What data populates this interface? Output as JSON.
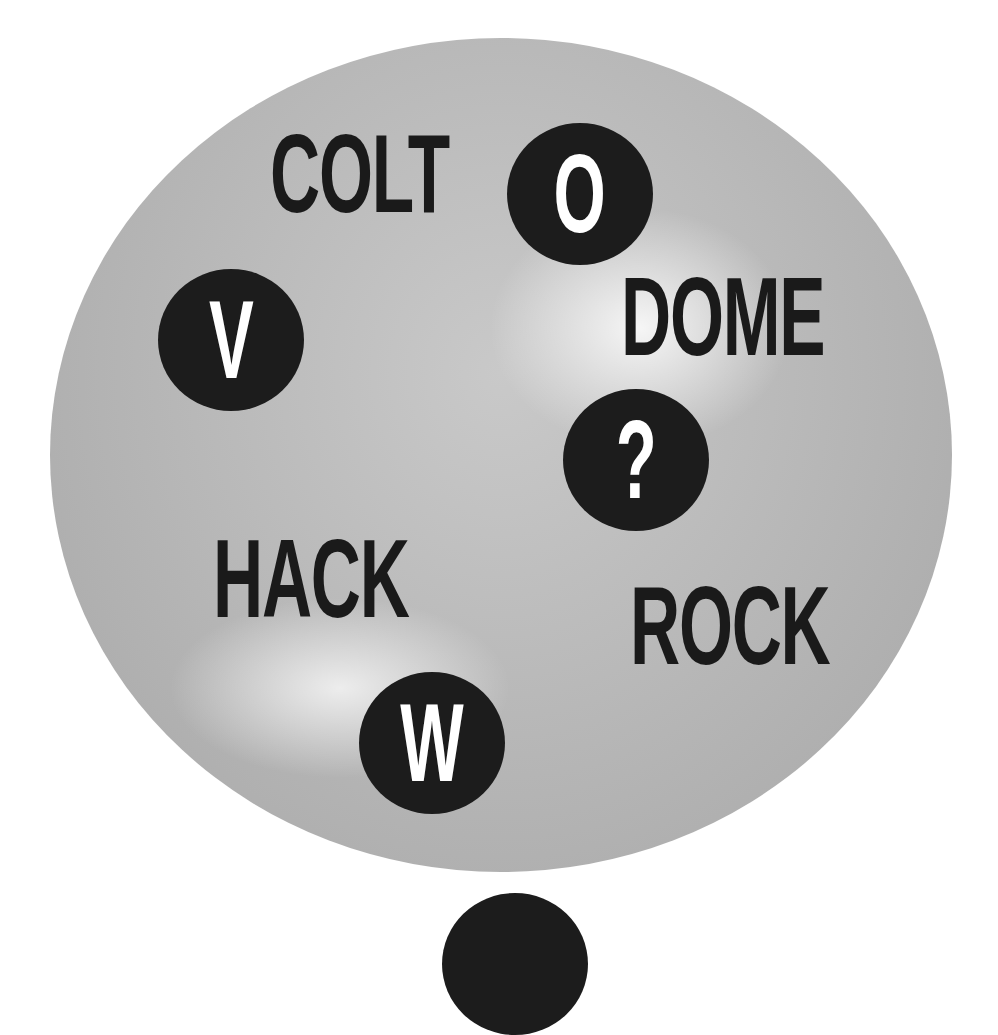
{
  "puzzle": {
    "words": [
      {
        "id": "colt",
        "text": "COLT"
      },
      {
        "id": "dome",
        "text": "DOME"
      },
      {
        "id": "hack",
        "text": "HACK"
      },
      {
        "id": "rock",
        "text": "ROCK"
      }
    ],
    "tokens": [
      {
        "id": "o",
        "text": "O"
      },
      {
        "id": "v",
        "text": "V"
      },
      {
        "id": "question",
        "text": "?"
      },
      {
        "id": "w",
        "text": "W"
      }
    ],
    "colors": {
      "disc": "#b8b8b8",
      "token": "#1c1c1c",
      "text": "#1a1a1a",
      "token_text": "#ffffff",
      "background": "#ffffff"
    }
  }
}
